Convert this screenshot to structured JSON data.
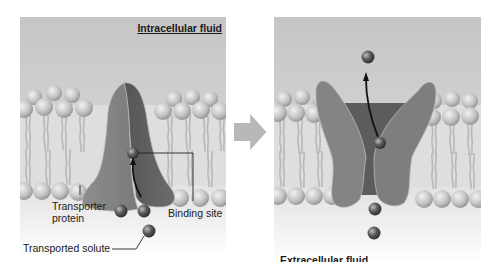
{
  "diagram": {
    "colors": {
      "intracellular_bg": "#c9c9c9",
      "extracellular_bg": "#ebebeb",
      "lipid_head": "#c4c4c4",
      "lipid_tail": "#bdbdbd",
      "protein_light": "#8a8a8a",
      "protein_dark": "#5e5e5e",
      "solute": "#4a4a4a",
      "arrow": "#111111",
      "transition_arrow": "#b4b4b4"
    },
    "panels": [
      {
        "id": "before",
        "region_label": "Intracellular fluid",
        "callouts": {
          "transporter_protein": "Transporter\nprotein",
          "transporter_line1": "Transporter",
          "transporter_line2": "protein",
          "binding_site": "Binding site",
          "transported_solute": "Transported solute"
        },
        "state": "open to extracellular side, solute entering binding site"
      },
      {
        "id": "after",
        "region_label": "Extracellular fluid",
        "state": "conformational change, open to intracellular side, solute released"
      }
    ],
    "transition_arrow": "right-arrow"
  }
}
